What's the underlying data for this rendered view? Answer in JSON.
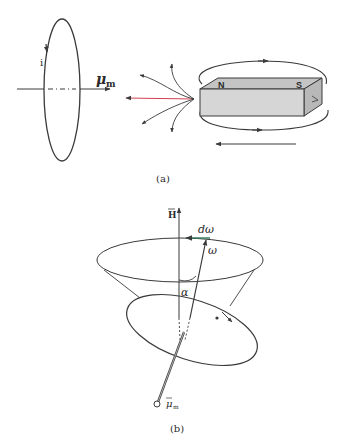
{
  "figure": {
    "panel_a": {
      "caption": "(a)",
      "loop_current_label": "i",
      "moment_label": "μ",
      "moment_sub": "m",
      "magnet_north": "N",
      "magnet_south": "S"
    },
    "panel_b": {
      "caption": "(b)",
      "field_label": "H",
      "dw_label": "dω",
      "w_label": "ω",
      "angle_label": "α",
      "moment_label": "μ",
      "moment_sub": "m"
    },
    "colors": {
      "line": "#3a3a3a",
      "field_line_red": "#d04050",
      "dw_arrow": "#2a7a5a",
      "magnet_face": "#d6d6d6",
      "magnet_top": "#c4c4c4",
      "magnet_side": "#b8b8b8"
    }
  }
}
